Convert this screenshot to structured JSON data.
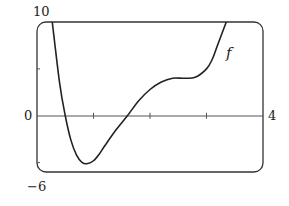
{
  "chart_data": {
    "type": "line",
    "title": "",
    "xlabel": "",
    "ylabel": "",
    "xlim": [
      0,
      4
    ],
    "ylim": [
      -6,
      10
    ],
    "x_tick_positions": [
      1,
      2,
      3
    ],
    "y_tick_positions": [
      5,
      -5
    ],
    "tick_labels": {
      "ymax": "10",
      "ymin": "-6",
      "origin": "0",
      "xmax": "4"
    },
    "series": [
      {
        "name": "f",
        "x": [
          0.27,
          0.4,
          0.5,
          0.6,
          0.7,
          0.8,
          0.9,
          1.0,
          1.1,
          1.2,
          1.4,
          1.6,
          1.8,
          2.0,
          2.2,
          2.4,
          2.6,
          2.8,
          3.0,
          3.1,
          3.2,
          3.35
        ],
        "values": [
          10,
          3.5,
          0,
          -2.6,
          -4.2,
          -5.0,
          -5.1,
          -4.8,
          -4.1,
          -3.2,
          -1.5,
          0,
          1.6,
          2.8,
          3.6,
          4.0,
          4.0,
          4.1,
          5.0,
          6.0,
          7.6,
          10
        ]
      }
    ],
    "annotations": [
      {
        "text": "f",
        "x": 3.5,
        "y": 6.2
      }
    ],
    "grid": false,
    "legend": "none"
  },
  "labels": {
    "ymax": "10",
    "ymin": "−6",
    "origin": "0",
    "xmax": "4",
    "curve": "f"
  }
}
